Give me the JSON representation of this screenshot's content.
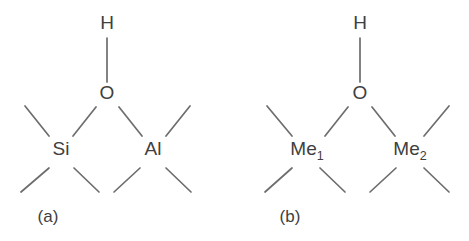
{
  "figure": {
    "width": 469,
    "height": 241,
    "background": "#ffffff",
    "bond_color": "#6d6d6d",
    "label_color": "#404040"
  },
  "panels": [
    {
      "caption": "(a)",
      "caption_x": 48,
      "caption_y": 222,
      "hydroxyl": {
        "h_label": "H",
        "h_x": 107,
        "h_y": 29,
        "o_label": "O",
        "o_x": 107,
        "o_y": 99,
        "bond": {
          "x1": 107,
          "y1": 38,
          "x2": 107,
          "y2": 82
        }
      },
      "centers": [
        {
          "label": "Si",
          "sub": "",
          "x": 61,
          "y": 155,
          "bridge_bond": {
            "x1": 96,
            "y1": 107,
            "x2": 73,
            "y2": 136
          },
          "outer_bonds": [
            {
              "x1": 49,
              "y1": 136,
              "x2": 25,
              "y2": 106
            },
            {
              "x1": 49,
              "y1": 168,
              "x2": 21,
              "y2": 192
            },
            {
              "x1": 74,
              "y1": 168,
              "x2": 99,
              "y2": 192
            }
          ]
        },
        {
          "label": "Al",
          "sub": "",
          "x": 153,
          "y": 155,
          "bridge_bond": {
            "x1": 119,
            "y1": 107,
            "x2": 142,
            "y2": 136
          },
          "outer_bonds": [
            {
              "x1": 166,
              "y1": 136,
              "x2": 190,
              "y2": 106
            },
            {
              "x1": 140,
              "y1": 168,
              "x2": 114,
              "y2": 192
            },
            {
              "x1": 166,
              "y1": 168,
              "x2": 191,
              "y2": 192
            }
          ]
        }
      ]
    },
    {
      "caption": "(b)",
      "caption_x": 290,
      "caption_y": 222,
      "hydroxyl": {
        "h_label": "H",
        "h_x": 360,
        "h_y": 29,
        "o_label": "O",
        "o_x": 360,
        "o_y": 99,
        "bond": {
          "x1": 360,
          "y1": 38,
          "x2": 360,
          "y2": 82
        }
      },
      "centers": [
        {
          "label": "Me",
          "sub": "1",
          "x": 307,
          "y": 155,
          "bridge_bond": {
            "x1": 348,
            "y1": 107,
            "x2": 325,
            "y2": 136
          },
          "outer_bonds": [
            {
              "x1": 292,
              "y1": 136,
              "x2": 267,
              "y2": 106
            },
            {
              "x1": 292,
              "y1": 168,
              "x2": 265,
              "y2": 192
            },
            {
              "x1": 320,
              "y1": 168,
              "x2": 345,
              "y2": 192
            }
          ]
        },
        {
          "label": "Me",
          "sub": "2",
          "x": 410,
          "y": 155,
          "bridge_bond": {
            "x1": 372,
            "y1": 107,
            "x2": 395,
            "y2": 136
          },
          "outer_bonds": [
            {
              "x1": 424,
              "y1": 136,
              "x2": 449,
              "y2": 106
            },
            {
              "x1": 396,
              "y1": 168,
              "x2": 370,
              "y2": 192
            },
            {
              "x1": 424,
              "y1": 168,
              "x2": 449,
              "y2": 192
            }
          ]
        }
      ]
    }
  ]
}
